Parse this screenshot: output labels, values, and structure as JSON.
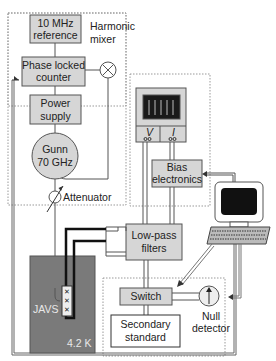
{
  "diagram": {
    "type": "block-diagram",
    "blocks": {
      "reference": {
        "line1": "10 MHz",
        "line2": "reference"
      },
      "counter": {
        "line1": "Phase locked",
        "line2": "counter"
      },
      "power": {
        "line1": "Power",
        "line2": "supply"
      },
      "gunn": {
        "line1": "Gunn",
        "line2": "70 GHz"
      },
      "bias": {
        "line1": "Bias",
        "line2": "electronics"
      },
      "filters": {
        "line1": "Low-pass",
        "line2": "filters"
      },
      "switch": {
        "label": "Switch"
      },
      "secondary": {
        "line1": "Secondary",
        "line2": "standard"
      },
      "javs": {
        "label": "JAVS",
        "temp": "4.2 K"
      }
    },
    "labels": {
      "mixer_line1": "Harmonic",
      "mixer_line2": "mixer",
      "attenuator": "Attenuator",
      "null_line1": "Null",
      "null_line2": "detector",
      "volt_terminal": "V",
      "current_terminal": "I"
    },
    "colors": {
      "block_fill": "#d6d6d6",
      "javs_fill": "#7a7a7a",
      "line": "#555555",
      "dotted": "#888888"
    }
  }
}
